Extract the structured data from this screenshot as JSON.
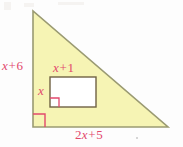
{
  "figure": {
    "colors": {
      "triangle_fill": "#f6f4b4",
      "triangle_stroke": "#9a9a72",
      "rectangle_fill": "#ffffff",
      "rectangle_stroke": "#6f6243",
      "label_text": "#e2486c",
      "right_angle_mark": "#e2486c",
      "background": "#fdfdfd"
    },
    "labels": {
      "left_side": {
        "var": "x",
        "op": "+",
        "num": "6",
        "full": "x + 6"
      },
      "rectangle_top": {
        "var": "x",
        "op": "+",
        "num": "1",
        "full": "x + 1"
      },
      "rectangle_left": {
        "var": "x",
        "full": "x"
      },
      "bottom_side": {
        "coef": "2",
        "var": "x",
        "op": "+",
        "num": "5",
        "full": "2x + 5"
      }
    },
    "marks": {
      "triangle_right_angle": "right-angle-marker",
      "rectangle_right_angle": "right-angle-marker"
    }
  }
}
